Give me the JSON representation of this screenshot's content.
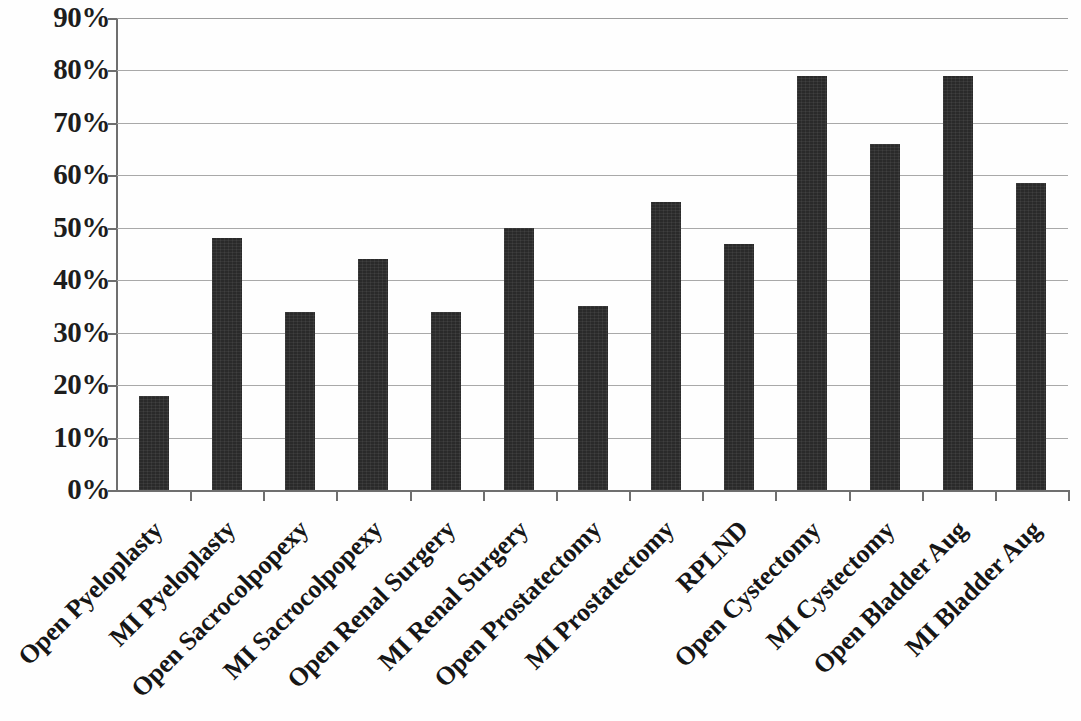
{
  "chart_data": {
    "type": "bar",
    "title": "",
    "subtitle": "",
    "xlabel": "",
    "ylabel": "",
    "ylim": [
      0,
      90
    ],
    "grid": true,
    "legend": false,
    "legend_position": "none",
    "orientation": "vertical",
    "bar_color": "#2a2a2a",
    "y_tick_labels": [
      "90%",
      "80%",
      "70%",
      "60%",
      "50%",
      "40%",
      "30%",
      "20%",
      "10%",
      "0%"
    ],
    "y_ticks": [
      90,
      80,
      70,
      60,
      50,
      40,
      30,
      20,
      10,
      0
    ],
    "categories": [
      "Open Pyeloplasty",
      "MI Pyeloplasty",
      "Open Sacrocolpopexy",
      "MI Sacrocolpopexy",
      "Open Renal Surgery",
      "MI Renal Surgery",
      "Open Prostatectomy",
      "MI Prostatectomy",
      "RPLND",
      "Open Cystectomy",
      "MI Cystectomy",
      "Open Bladder Aug",
      "MI Bladder Aug"
    ],
    "values": [
      18,
      48,
      34,
      44,
      34,
      50,
      35,
      55,
      47,
      79,
      66,
      79,
      58.5
    ],
    "value_unit": "%"
  }
}
